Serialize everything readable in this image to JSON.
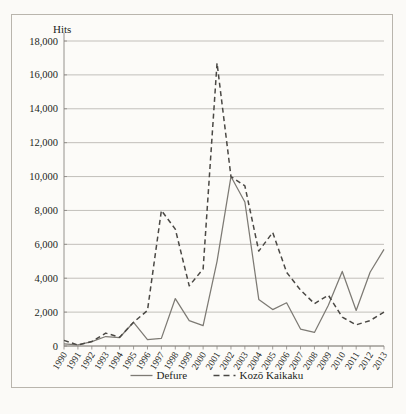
{
  "chart_data": {
    "type": "line",
    "title": "",
    "xlabel": "",
    "ylabel": "Hits",
    "ylim": [
      0,
      18000
    ],
    "ytick_labels": [
      "18,000",
      "16,000",
      "14,000",
      "12,000",
      "10,000",
      "8,000",
      "6,000",
      "4,000",
      "2,000",
      "0"
    ],
    "ytick_values": [
      18000,
      16000,
      14000,
      12000,
      10000,
      8000,
      6000,
      4000,
      2000,
      0
    ],
    "grid": true,
    "legend_position": "bottom",
    "categories": [
      "1990",
      "1991",
      "1992",
      "1993",
      "1994",
      "1995",
      "1996",
      "1997",
      "1998",
      "1999",
      "2000",
      "2001",
      "2002",
      "2003",
      "2004",
      "2005",
      "2006",
      "2007",
      "2008",
      "2009",
      "2010",
      "2011",
      "2012",
      "2013"
    ],
    "series": [
      {
        "name": "Defure",
        "style": "solid",
        "color": "#7d7a74",
        "values": [
          120,
          60,
          260,
          560,
          500,
          1400,
          380,
          450,
          2800,
          1500,
          1200,
          5000,
          10000,
          8500,
          2750,
          2150,
          2550,
          1000,
          800,
          2400,
          4400,
          2100,
          4350,
          5700
        ]
      },
      {
        "name": "Kozō Kaikaku",
        "style": "dashed",
        "color": "#4a4844",
        "values": [
          330,
          60,
          260,
          760,
          520,
          1400,
          2100,
          8000,
          6900,
          3550,
          4550,
          16700,
          10000,
          9450,
          5600,
          6700,
          4350,
          3300,
          2500,
          3000,
          1700,
          1250,
          1500,
          2000
        ]
      }
    ]
  },
  "legend": {
    "items": [
      {
        "label": "Defure",
        "style": "solid"
      },
      {
        "label": "Kozō Kaikaku",
        "style": "dashed"
      }
    ]
  },
  "colors": {
    "background": "#fbfaf7",
    "panel": "#fcfbf8",
    "border": "#b9b5ad",
    "gridline": "#a9a6a0",
    "axis": "#8a8782",
    "text": "#231f1c",
    "series_solid": "#7d7a74",
    "series_dashed": "#4a4844"
  }
}
